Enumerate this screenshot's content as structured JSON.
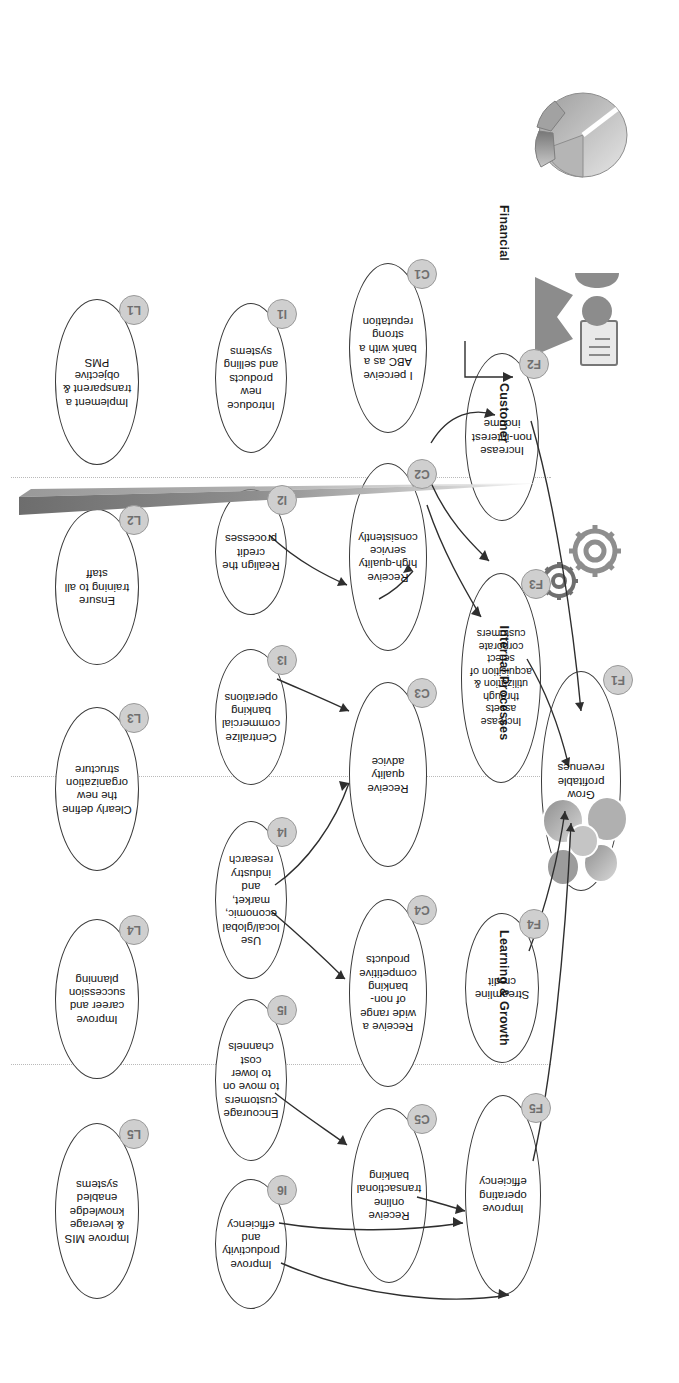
{
  "diagram": {
    "type": "balanced-scorecard-strategy-map",
    "orientation": "rotated-180",
    "accent_badge_fill": "#cfcfcf",
    "accent_badge_text": "#6f6f6f",
    "node_stroke": "#3a3a3a",
    "divider_color": "#b9b9b9"
  },
  "perspectives": [
    {
      "id": "financial",
      "label": "Financial",
      "icon": "pie-chart-icon"
    },
    {
      "id": "customer",
      "label": "Customer",
      "icon": "customer-person-document-icon"
    },
    {
      "id": "internal",
      "label": "Internal Processes",
      "icon": "gears-icon"
    },
    {
      "id": "learning",
      "label": "Learning & Growth",
      "icon": "people-group-icon"
    }
  ],
  "nodes": {
    "F1": {
      "code": "F1",
      "text": "Grow profitable revenues"
    },
    "F2": {
      "code": "F2",
      "text": "Increase non-interest income"
    },
    "F3": {
      "code": "F3",
      "text": "Increase assets through utilization & acquisition of select corporate customers"
    },
    "F4": {
      "code": "F4",
      "text": "Streamline credit"
    },
    "F5": {
      "code": "F5",
      "text": "Improve operating efficiency"
    },
    "C1": {
      "code": "C1",
      "text": "I perceive ABC as a bank with a strong reputation"
    },
    "C2": {
      "code": "C2",
      "text": "Receive high-quality service consistently"
    },
    "C3": {
      "code": "C3",
      "text": "Receive quality advice"
    },
    "C4": {
      "code": "C4",
      "text": "Receive a wide range of non-banking competitive products"
    },
    "C5": {
      "code": "C5",
      "text": "Receive online transactional banking"
    },
    "I1": {
      "code": "I1",
      "text": "Introduce new products and selling systems"
    },
    "I2": {
      "code": "I2",
      "text": "Realign the credit processes"
    },
    "I3": {
      "code": "I3",
      "text": "Centralize commercial banking operations"
    },
    "I4": {
      "code": "I4",
      "text": "Use local/global economic, market, and industry research"
    },
    "I5": {
      "code": "I5",
      "text": "Encourage customers to move on to lower cost channels"
    },
    "I6": {
      "code": "I6",
      "text": "Improve productivity and efficiency"
    },
    "L1": {
      "code": "L1",
      "text": "Implement a transparent & objective PMS"
    },
    "L2": {
      "code": "L2",
      "text": "Ensure training to all staff"
    },
    "L3": {
      "code": "L3",
      "text": "Clearly define the new organization structure"
    },
    "L4": {
      "code": "L4",
      "text": "Improve career and succession planning"
    },
    "L5": {
      "code": "L5",
      "text": "Improve MIS & leverage knowledge enabled systems"
    }
  }
}
